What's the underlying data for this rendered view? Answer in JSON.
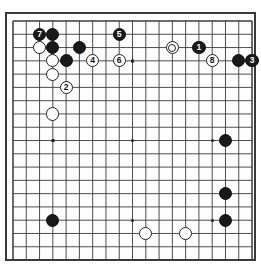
{
  "diagram": {
    "type": "go-board-diagram",
    "board_size": 19,
    "background_color": "#ffffff",
    "board_color": "#fdfdfd",
    "line_color": "#3a3a3a",
    "black_color": "#191919",
    "white_color": "#ffffff",
    "geometry": {
      "origin_x": 11,
      "origin_y": 19,
      "cell": 13.28,
      "stone_diameter": 13.2
    },
    "star_points": [
      {
        "col": 3,
        "row": 3
      },
      {
        "col": 9,
        "row": 3
      },
      {
        "col": 15,
        "row": 3
      },
      {
        "col": 3,
        "row": 9
      },
      {
        "col": 9,
        "row": 9
      },
      {
        "col": 15,
        "row": 9
      },
      {
        "col": 3,
        "row": 15
      },
      {
        "col": 9,
        "row": 15
      },
      {
        "col": 15,
        "row": 15
      }
    ],
    "stones": [
      {
        "id": "b-c2r1-move7",
        "color": "black",
        "col": 2,
        "row": 1,
        "label": "7"
      },
      {
        "id": "b-c3r1",
        "color": "black",
        "col": 3,
        "row": 1,
        "label": ""
      },
      {
        "id": "b-c8r1-move5",
        "color": "black",
        "col": 8,
        "row": 1,
        "label": "5"
      },
      {
        "id": "w-c2r2",
        "color": "white",
        "col": 2,
        "row": 2,
        "label": ""
      },
      {
        "id": "b-c3r2",
        "color": "black",
        "col": 3,
        "row": 2,
        "label": ""
      },
      {
        "id": "b-c5r2",
        "color": "black",
        "col": 5,
        "row": 2,
        "label": ""
      },
      {
        "id": "w-c12r2-marked",
        "color": "white",
        "col": 12,
        "row": 2,
        "label": "",
        "marked": true
      },
      {
        "id": "b-c14r2-move1",
        "color": "black",
        "col": 14,
        "row": 2,
        "label": "1"
      },
      {
        "id": "w-c3r3",
        "color": "white",
        "col": 3,
        "row": 3,
        "label": ""
      },
      {
        "id": "b-c4r3",
        "color": "black",
        "col": 4,
        "row": 3,
        "label": ""
      },
      {
        "id": "w-c6r3-move4",
        "color": "white",
        "col": 6,
        "row": 3,
        "label": "4"
      },
      {
        "id": "w-c8r3-move6",
        "color": "white",
        "col": 8,
        "row": 3,
        "label": "6"
      },
      {
        "id": "w-c15r3-move8",
        "color": "white",
        "col": 15,
        "row": 3,
        "label": "8"
      },
      {
        "id": "b-c17r3",
        "color": "black",
        "col": 17,
        "row": 3,
        "label": ""
      },
      {
        "id": "b-c18r3-move3",
        "color": "black",
        "col": 18,
        "row": 3,
        "label": "3"
      },
      {
        "id": "w-c3r4",
        "color": "white",
        "col": 3,
        "row": 4,
        "label": ""
      },
      {
        "id": "w-c4r5-move2",
        "color": "white",
        "col": 4,
        "row": 5,
        "label": "2"
      },
      {
        "id": "w-c3r7",
        "color": "white",
        "col": 3,
        "row": 7,
        "label": ""
      },
      {
        "id": "b-c16r9",
        "color": "black",
        "col": 16,
        "row": 9,
        "label": ""
      },
      {
        "id": "b-c16r13",
        "color": "black",
        "col": 16,
        "row": 13,
        "label": ""
      },
      {
        "id": "b-c16r15",
        "color": "black",
        "col": 16,
        "row": 15,
        "label": ""
      },
      {
        "id": "b-c3r15",
        "color": "black",
        "col": 3,
        "row": 15,
        "label": ""
      },
      {
        "id": "w-c10r16",
        "color": "white",
        "col": 10,
        "row": 16,
        "label": ""
      },
      {
        "id": "w-c13r16",
        "color": "white",
        "col": 13,
        "row": 16,
        "label": ""
      }
    ]
  }
}
